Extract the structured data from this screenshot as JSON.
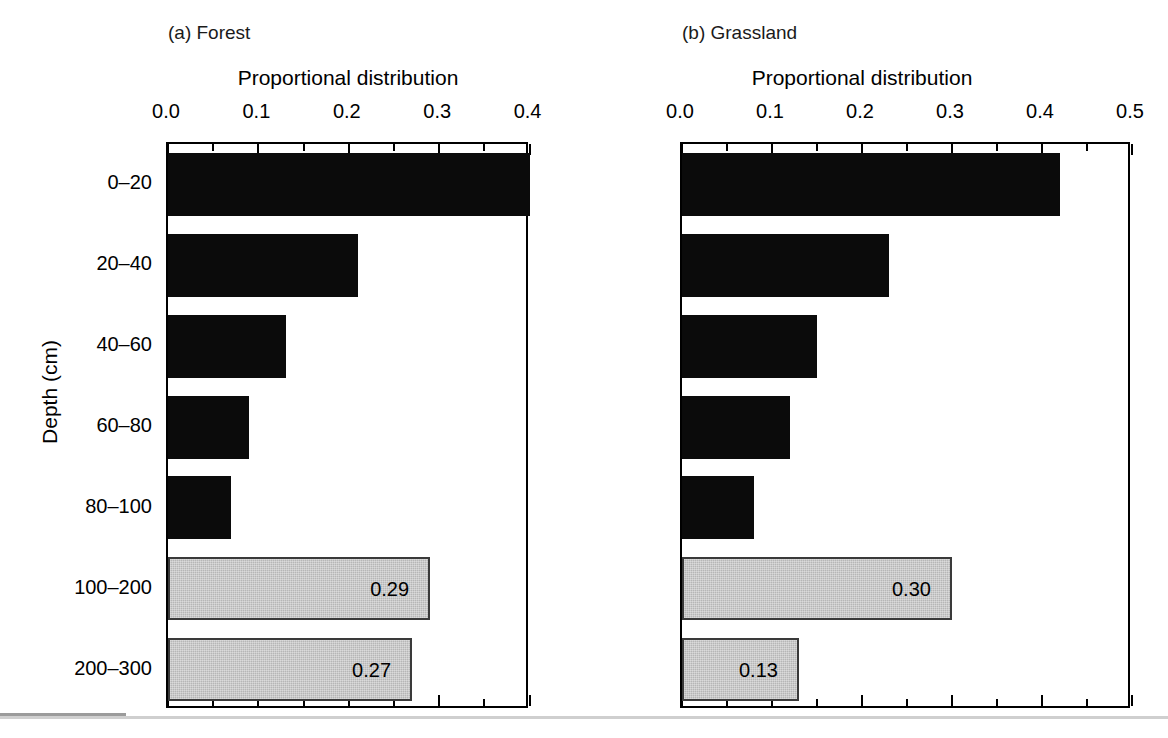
{
  "figure": {
    "y_axis_title": "Depth (cm)",
    "panels": [
      {
        "key": "a",
        "title": "(a) Forest",
        "x_axis_title": "Proportional distribution"
      },
      {
        "key": "b",
        "title": "(b) Grassland",
        "x_axis_title": "Proportional distribution"
      }
    ]
  },
  "chart_data": {
    "type": "bar",
    "orientation": "horizontal",
    "title": "",
    "xlabel": "Proportional distribution",
    "ylabel": "Depth (cm)",
    "xlim": [
      0.0,
      0.5
    ],
    "xticks": [
      0.0,
      0.1,
      0.2,
      0.3,
      0.4,
      0.5
    ],
    "xticklabels": [
      "0.0",
      "0.1",
      "0.2",
      "0.3",
      "0.4",
      "0.5"
    ],
    "minor_ticks": true,
    "grid": false,
    "legend": "none",
    "categories": [
      "0–20",
      "20–40",
      "40–60",
      "60–80",
      "80–100",
      "100–200",
      "200–300"
    ],
    "colors": {
      "black_bar": "#0b0b0b",
      "gray_bar": "#b6b6b6",
      "gray_bar_edge": "#3a3a3a",
      "axis": "#000000",
      "background": "#ffffff"
    },
    "panels": [
      {
        "name": "(a) Forest",
        "values": [
          0.5,
          0.21,
          0.13,
          0.09,
          0.07,
          0.29,
          0.27
        ],
        "bar_styles": [
          "black",
          "black",
          "black",
          "black",
          "black",
          "gray",
          "gray"
        ],
        "labels": [
          "",
          "",
          "",
          "",
          "",
          "0.29",
          "0.27"
        ]
      },
      {
        "name": "(b) Grassland",
        "values": [
          0.42,
          0.23,
          0.15,
          0.12,
          0.08,
          0.3,
          0.13
        ],
        "bar_styles": [
          "black",
          "black",
          "black",
          "black",
          "black",
          "gray",
          "gray"
        ],
        "labels": [
          "",
          "",
          "",
          "",
          "",
          "0.30",
          "0.13"
        ]
      }
    ]
  }
}
